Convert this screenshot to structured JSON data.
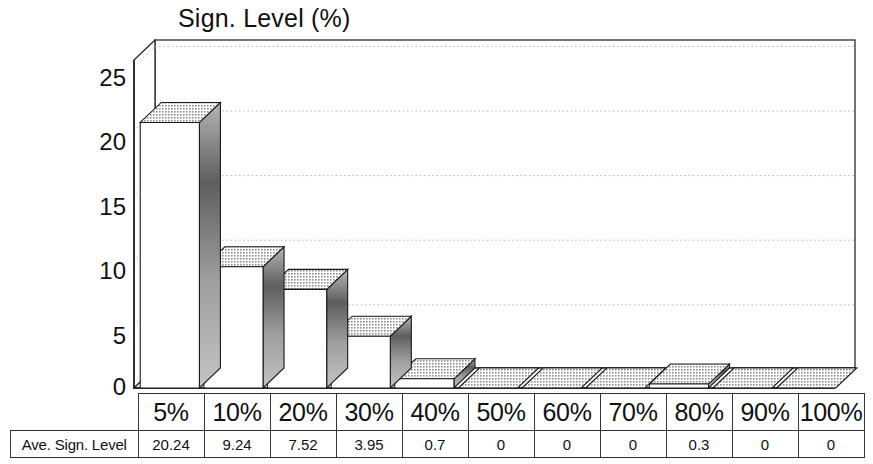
{
  "chart_data": {
    "type": "bar",
    "title": "Sign. Level (%)",
    "xlabel": "",
    "ylabel": "",
    "grid": true,
    "legend": "none",
    "three_d": true,
    "ylim": [
      0,
      25
    ],
    "yticks": [
      0,
      5,
      10,
      15,
      20,
      25
    ],
    "ytick_labels": [
      "0",
      "5",
      "10",
      "15",
      "20",
      "25"
    ],
    "categories": [
      "5%",
      "10%",
      "20%",
      "30%",
      "40%",
      "50%",
      "60%",
      "70%",
      "80%",
      "90%",
      "100%"
    ],
    "series": [
      {
        "name": "Ave. Sign. Level",
        "values": [
          20.24,
          9.24,
          7.52,
          3.95,
          0.7,
          0,
          0,
          0,
          0.3,
          0,
          0
        ]
      }
    ]
  },
  "table": {
    "corner_label": "",
    "row_label": "Ave. Sign. Level",
    "column_headers": [
      "5%",
      "10%",
      "20%",
      "30%",
      "40%",
      "50%",
      "60%",
      "70%",
      "80%",
      "90%",
      "100%"
    ],
    "row_values": [
      "20.24",
      "9.24",
      "7.52",
      "3.95",
      "0.7",
      "0",
      "0",
      "0",
      "0.3",
      "0",
      "0"
    ]
  },
  "colors": {
    "background": "#ffffff",
    "axis_line": "#222222",
    "gridline": "#bbbbbb",
    "bar_front": "#ffffff",
    "bar_top": "#c9c9c9",
    "bar_side": "#9a9a9a",
    "bar_outline": "#1a1a1a",
    "text": "#111111",
    "table_border": "#333333"
  }
}
